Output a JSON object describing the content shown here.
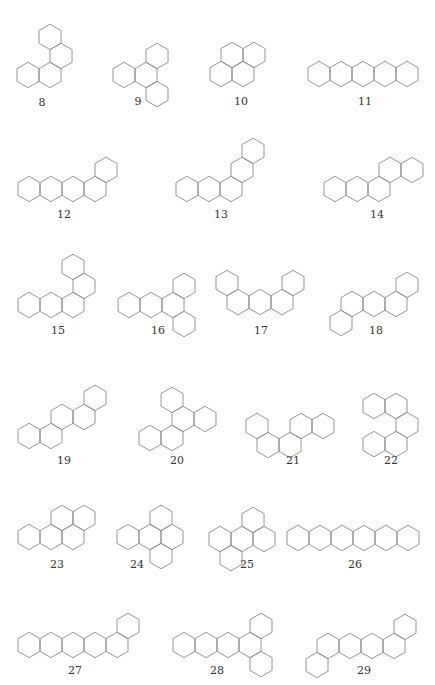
{
  "figure": {
    "hex": {
      "ring_width": 22,
      "side": 12.7,
      "stroke_color": "#8a8a8a"
    },
    "structures": [
      {
        "id": "8",
        "label": "8",
        "origin": [
          28,
          75
        ],
        "label_pos": [
          42,
          103
        ],
        "rings": [
          [
            0,
            0
          ],
          [
            1,
            0
          ],
          [
            1,
            1
          ],
          [
            0,
            2
          ]
        ]
      },
      {
        "id": "9",
        "label": "9",
        "origin": [
          124,
          75
        ],
        "label_pos": [
          138,
          102
        ],
        "rings": [
          [
            0,
            0
          ],
          [
            1,
            0
          ],
          [
            1,
            1
          ],
          [
            2,
            -1
          ]
        ]
      },
      {
        "id": "10",
        "label": "10",
        "origin": [
          221,
          74
        ],
        "label_pos": [
          241,
          102
        ],
        "rings": [
          [
            0,
            0
          ],
          [
            1,
            0
          ],
          [
            0,
            1
          ],
          [
            1,
            1
          ]
        ]
      },
      {
        "id": "11",
        "label": "11",
        "origin": [
          319,
          74
        ],
        "label_pos": [
          365,
          102
        ],
        "rings": [
          [
            0,
            0
          ],
          [
            1,
            0
          ],
          [
            2,
            0
          ],
          [
            3,
            0
          ],
          [
            4,
            0
          ]
        ]
      },
      {
        "id": "12",
        "label": "12",
        "origin": [
          29,
          189
        ],
        "label_pos": [
          64,
          215
        ],
        "rings": [
          [
            0,
            0
          ],
          [
            1,
            0
          ],
          [
            2,
            0
          ],
          [
            3,
            0
          ],
          [
            3,
            1
          ]
        ]
      },
      {
        "id": "13",
        "label": "13",
        "origin": [
          187,
          189
        ],
        "label_pos": [
          221,
          215
        ],
        "rings": [
          [
            0,
            0
          ],
          [
            1,
            0
          ],
          [
            2,
            0
          ],
          [
            2,
            1
          ],
          [
            2,
            2
          ]
        ]
      },
      {
        "id": "14",
        "label": "14",
        "origin": [
          335,
          189
        ],
        "label_pos": [
          377,
          215
        ],
        "rings": [
          [
            0,
            0
          ],
          [
            1,
            0
          ],
          [
            2,
            0
          ],
          [
            2,
            1
          ],
          [
            3,
            1
          ]
        ]
      },
      {
        "id": "15",
        "label": "15",
        "origin": [
          29,
          305
        ],
        "label_pos": [
          58,
          331
        ],
        "rings": [
          [
            0,
            0
          ],
          [
            1,
            0
          ],
          [
            2,
            0
          ],
          [
            2,
            1
          ],
          [
            1,
            2
          ]
        ]
      },
      {
        "id": "16",
        "label": "16",
        "origin": [
          129,
          305
        ],
        "label_pos": [
          158,
          331
        ],
        "rings": [
          [
            0,
            0
          ],
          [
            1,
            0
          ],
          [
            2,
            0
          ],
          [
            2,
            1
          ],
          [
            3,
            -1
          ]
        ]
      },
      {
        "id": "17",
        "label": "17",
        "origin": [
          227,
          283
        ],
        "label_pos": [
          261,
          331
        ],
        "rings": [
          [
            0,
            0
          ],
          [
            1,
            -1
          ],
          [
            2,
            -1
          ],
          [
            3,
            -1
          ],
          [
            3,
            0
          ]
        ]
      },
      {
        "id": "18",
        "label": "18",
        "origin": [
          341,
          323
        ],
        "label_pos": [
          376,
          331
        ],
        "rings": [
          [
            0,
            0
          ],
          [
            0,
            1
          ],
          [
            1,
            1
          ],
          [
            2,
            1
          ],
          [
            2,
            2
          ]
        ]
      },
      {
        "id": "19",
        "label": "19",
        "origin": [
          29,
          436
        ],
        "label_pos": [
          64,
          461
        ],
        "rings": [
          [
            0,
            0
          ],
          [
            1,
            0
          ],
          [
            1,
            1
          ],
          [
            2,
            1
          ],
          [
            2,
            2
          ]
        ]
      },
      {
        "id": "20",
        "label": "20",
        "origin": [
          150,
          438
        ],
        "label_pos": [
          177,
          461
        ],
        "rings": [
          [
            0,
            0
          ],
          [
            1,
            0
          ],
          [
            1,
            1
          ],
          [
            2,
            1
          ],
          [
            0,
            2
          ]
        ]
      },
      {
        "id": "21",
        "label": "21",
        "origin": [
          257,
          426
        ],
        "label_pos": [
          293,
          461
        ],
        "rings": [
          [
            0,
            0
          ],
          [
            1,
            -1
          ],
          [
            2,
            -1
          ],
          [
            2,
            0
          ],
          [
            3,
            0
          ]
        ]
      },
      {
        "id": "22",
        "label": "22",
        "origin": [
          374,
          406
        ],
        "label_pos": [
          391,
          461
        ],
        "rings": [
          [
            0,
            0
          ],
          [
            1,
            0
          ],
          [
            2,
            -1
          ],
          [
            1,
            -2
          ],
          [
            2,
            -2
          ]
        ]
      },
      {
        "id": "23",
        "label": "23",
        "origin": [
          29,
          537
        ],
        "label_pos": [
          57,
          565
        ],
        "rings": [
          [
            0,
            0
          ],
          [
            1,
            0
          ],
          [
            2,
            0
          ],
          [
            1,
            1
          ],
          [
            2,
            1
          ]
        ]
      },
      {
        "id": "24",
        "label": "24",
        "origin": [
          128,
          537
        ],
        "label_pos": [
          137,
          565
        ],
        "rings": [
          [
            0,
            0
          ],
          [
            1,
            0
          ],
          [
            2,
            0
          ],
          [
            1,
            1
          ],
          [
            2,
            -1
          ]
        ]
      },
      {
        "id": "25",
        "label": "25",
        "origin": [
          220,
          539
        ],
        "label_pos": [
          247,
          565
        ],
        "rings": [
          [
            0,
            0
          ],
          [
            1,
            0
          ],
          [
            2,
            0
          ],
          [
            1,
            1
          ],
          [
            1,
            -1
          ]
        ]
      },
      {
        "id": "26",
        "label": "26",
        "origin": [
          298,
          538
        ],
        "label_pos": [
          355,
          565
        ],
        "rings": [
          [
            0,
            0
          ],
          [
            1,
            0
          ],
          [
            2,
            0
          ],
          [
            3,
            0
          ],
          [
            4,
            0
          ],
          [
            5,
            0
          ]
        ]
      },
      {
        "id": "27",
        "label": "27",
        "origin": [
          29,
          645
        ],
        "label_pos": [
          75,
          671
        ],
        "rings": [
          [
            0,
            0
          ],
          [
            1,
            0
          ],
          [
            2,
            0
          ],
          [
            3,
            0
          ],
          [
            4,
            0
          ],
          [
            4,
            1
          ]
        ]
      },
      {
        "id": "28",
        "label": "28",
        "origin": [
          184,
          645
        ],
        "label_pos": [
          217,
          671
        ],
        "rings": [
          [
            0,
            0
          ],
          [
            1,
            0
          ],
          [
            2,
            0
          ],
          [
            3,
            0
          ],
          [
            3,
            1
          ],
          [
            4,
            -1
          ]
        ]
      },
      {
        "id": "29",
        "label": "29",
        "origin": [
          317,
          665
        ],
        "label_pos": [
          364,
          671
        ],
        "rings": [
          [
            0,
            0
          ],
          [
            0,
            1
          ],
          [
            1,
            1
          ],
          [
            2,
            1
          ],
          [
            3,
            1
          ],
          [
            3,
            2
          ]
        ]
      }
    ]
  }
}
